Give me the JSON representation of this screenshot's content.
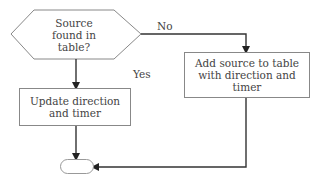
{
  "diagram": {
    "type": "flowchart",
    "decision": {
      "text_lines": [
        "Source",
        "found in",
        "table?"
      ]
    },
    "process_update": {
      "text_lines": [
        "Update direction",
        "and timer"
      ]
    },
    "process_add": {
      "text_lines": [
        "Add source to table",
        "with direction and",
        "timer"
      ]
    },
    "edges": {
      "no_label": "No",
      "yes_label": "Yes"
    },
    "terminator": {
      "text": ""
    },
    "colors": {
      "stroke": "#888888",
      "arrow": "#222222",
      "text": "#444444"
    }
  }
}
